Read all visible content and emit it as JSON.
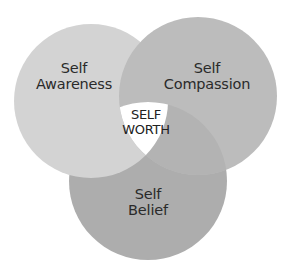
{
  "diagram": {
    "type": "venn-3",
    "colors": {
      "background": "#ffffff",
      "self_awareness": "#d3d3d3",
      "self_compassion": "#bcbcbc",
      "self_belief": "#adadad",
      "center": "#ffffff",
      "text": "#2a2a2a"
    },
    "circles": [
      {
        "id": "self_awareness",
        "line1": "Self",
        "line2": "Awareness",
        "cx": 91,
        "cy": 101,
        "r": 77
      },
      {
        "id": "self_compassion",
        "line1": "Self",
        "line2": "Compassion",
        "cx": 198,
        "cy": 96,
        "r": 79
      },
      {
        "id": "self_belief",
        "line1": "Self",
        "line2": "Belief",
        "cx": 148,
        "cy": 181,
        "r": 79
      }
    ],
    "center": {
      "line1": "SELF",
      "line2": "WORTH"
    }
  }
}
